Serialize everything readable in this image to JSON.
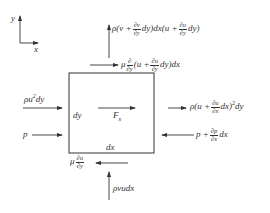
{
  "diagram": {
    "axes": {
      "x_label": "x",
      "y_label": "y"
    },
    "element": {
      "width_label": "dx",
      "height_label": "dy",
      "body_force_label": "F",
      "body_force_sub": "x"
    },
    "forces": {
      "top_flux": {
        "prefix": "ρ(v +",
        "frac_num": "∂v",
        "frac_den": "∂y",
        "middle": "dy)dx(u +",
        "frac2_num": "∂u",
        "frac2_den": "∂y",
        "suffix": "dy)"
      },
      "top_shear": {
        "prefix": "μ",
        "frac_num": "∂",
        "frac_den": "∂y",
        "middle": "(u +",
        "frac2_num": "∂u",
        "frac2_den": "∂y",
        "suffix": "dy)dx"
      },
      "left_flux": {
        "text": "ρu",
        "sup": "2",
        "suffix": "dy"
      },
      "left_pressure": {
        "text": "p"
      },
      "right_flux": {
        "prefix": "ρ(u +",
        "frac_num": "∂u",
        "frac_den": "∂x",
        "suffix": "dx)",
        "sup": "2",
        "tail": "dy"
      },
      "right_pressure": {
        "prefix": "p +",
        "frac_num": "∂p",
        "frac_den": "∂x",
        "suffix": "dx"
      },
      "bottom_shear": {
        "prefix": "μ",
        "frac_num": "∂u",
        "frac_den": "∂y"
      },
      "bottom_flux": {
        "text": "ρvudx"
      }
    },
    "colors": {
      "line": "#333333",
      "background": "#ffffff"
    }
  }
}
